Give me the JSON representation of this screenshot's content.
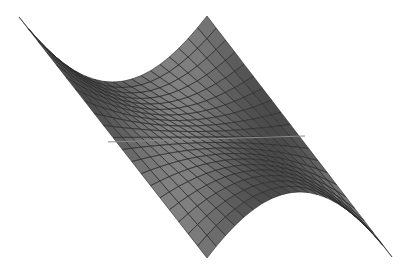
{
  "chart_data": {
    "type": "surface",
    "title": "",
    "function": "z = x^2 - y^2",
    "x_range": [
      -1,
      1
    ],
    "y_range": [
      -1,
      1
    ],
    "grid_divisions": 20,
    "xlabel": "",
    "ylabel": "",
    "zlabel": "",
    "axes_visible": false,
    "colors": {
      "surface_fill": "#4a4a4a",
      "mesh_line": "#262626",
      "background": "#ffffff",
      "axis_line": "#8a8a8a"
    }
  }
}
